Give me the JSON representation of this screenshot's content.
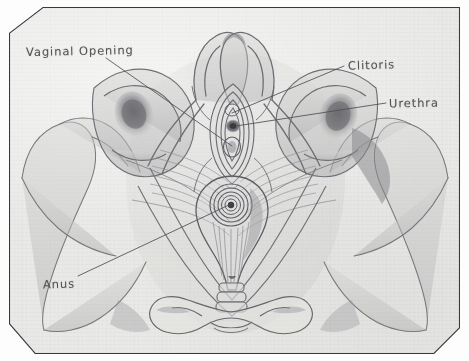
{
  "document": {
    "kind": "hand-drawn pencil anatomical sketch",
    "subject": "Female pelvic floor, inferior (lithotomy) view",
    "medium": "graphite pencil on textured paper",
    "frame_style": "chamfered-corner rectangular border"
  },
  "palette": {
    "paper": "#e9e9e7",
    "outer_margin": "#fdfdfd",
    "frame_line": "#3d3d42",
    "pencil_line": "#6d6d73",
    "pencil_dark": "#4a4a4e",
    "shadow_fill": "#a9a9ad",
    "label_text": "#4a4a4c"
  },
  "labels": [
    {
      "id": "vaginal-opening",
      "text": "Vaginal Opening",
      "position": "top-left",
      "leader_from": [
        133,
        60
      ],
      "leader_to": [
        232,
        144
      ]
    },
    {
      "id": "clitoris",
      "text": "Clitoris",
      "position": "upper-right",
      "leader_from": [
        344,
        66
      ],
      "leader_to": [
        231,
        114
      ]
    },
    {
      "id": "urethra",
      "text": "Urethra",
      "position": "right",
      "leader_from": [
        386,
        103
      ],
      "leader_to": [
        234,
        126
      ]
    },
    {
      "id": "anus",
      "text": "Anus",
      "position": "bottom-left",
      "leader_from": [
        80,
        276
      ],
      "leader_to": [
        230,
        200
      ]
    }
  ],
  "structures": [
    {
      "id": "pubic-rami",
      "name": "Superior pubic rami",
      "region": "top-center"
    },
    {
      "id": "vulva",
      "name": "Vulvar vestibule",
      "region": "center-upper"
    },
    {
      "id": "urethral-opening",
      "name": "External urethral orifice",
      "region": "center-upper"
    },
    {
      "id": "vaginal-orifice",
      "name": "Vaginal orifice",
      "region": "center"
    },
    {
      "id": "perineal-body",
      "name": "Perineal body",
      "region": "center"
    },
    {
      "id": "anal-sphincter",
      "name": "External anal sphincter",
      "region": "center-lower"
    },
    {
      "id": "levator-ani",
      "name": "Levator ani muscle fibres",
      "region": "mid-lateral"
    },
    {
      "id": "ischial-tuberosity-left",
      "name": "Left ischial tuberosity",
      "region": "left"
    },
    {
      "id": "ischial-tuberosity-right",
      "name": "Right ischial tuberosity",
      "region": "right"
    },
    {
      "id": "acetabulum-left",
      "name": "Left acetabulum (shaded)",
      "region": "left"
    },
    {
      "id": "acetabulum-right",
      "name": "Right acetabulum (shaded)",
      "region": "right"
    },
    {
      "id": "coccyx",
      "name": "Coccygeal segments",
      "region": "bottom-center"
    },
    {
      "id": "sacrum",
      "name": "Sacrum",
      "region": "bottom-center"
    },
    {
      "id": "ilium-left",
      "name": "Left iliac wing",
      "region": "far-left"
    },
    {
      "id": "ilium-right",
      "name": "Right iliac wing",
      "region": "far-right"
    }
  ]
}
